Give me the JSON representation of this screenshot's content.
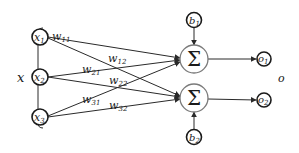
{
  "diagram": {
    "type": "neural-network-layer",
    "input_group_label": "x",
    "output_group_label": "o",
    "inputs": [
      {
        "id": "x1",
        "base": "x",
        "sub": "1",
        "cx": 40,
        "cy": 37
      },
      {
        "id": "x2",
        "base": "x",
        "sub": "2",
        "cx": 40,
        "cy": 77
      },
      {
        "id": "x3",
        "base": "x",
        "sub": "3",
        "cx": 40,
        "cy": 117
      }
    ],
    "biases": [
      {
        "id": "b1",
        "base": "b",
        "sub": "1",
        "cx": 194,
        "cy": 20
      },
      {
        "id": "b2",
        "base": "b",
        "sub": "2",
        "cx": 194,
        "cy": 137
      }
    ],
    "summations": [
      {
        "id": "sum1",
        "symbol": "Σ",
        "cx": 194,
        "cy": 59
      },
      {
        "id": "sum2",
        "symbol": "Σ",
        "cx": 194,
        "cy": 98
      }
    ],
    "outputs": [
      {
        "id": "o1",
        "base": "o",
        "sub": "1",
        "cx": 264,
        "cy": 59
      },
      {
        "id": "o2",
        "base": "o",
        "sub": "2",
        "cx": 264,
        "cy": 100
      }
    ],
    "weights": [
      {
        "label": "w",
        "sub": "11",
        "from": "x1",
        "to": "sum1"
      },
      {
        "label": "w",
        "sub": "12",
        "from": "x1",
        "to": "sum2"
      },
      {
        "label": "w",
        "sub": "21",
        "from": "x2",
        "to": "sum1"
      },
      {
        "label": "w",
        "sub": "22",
        "from": "x2",
        "to": "sum2"
      },
      {
        "label": "w",
        "sub": "31",
        "from": "x3",
        "to": "sum1"
      },
      {
        "label": "w",
        "sub": "32",
        "from": "x3",
        "to": "sum2"
      }
    ],
    "colors": {
      "stroke": "#1a1a1a",
      "sum_stroke": "#7a7a7a",
      "background": "#ffffff"
    }
  }
}
